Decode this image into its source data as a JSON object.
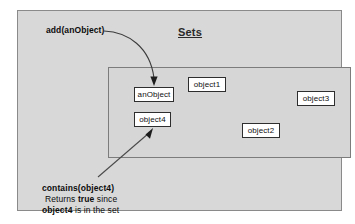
{
  "diagram": {
    "title": "Sets",
    "background_color": "#d8d8d8",
    "page_color": "#ffffff",
    "border_color": "#8a8a8a"
  },
  "set_container": {
    "label": "Sets",
    "fill": "#d6d6d6",
    "border": "#7c7c7c"
  },
  "objects": [
    {
      "id": "anObject",
      "label": "anObject"
    },
    {
      "id": "object4",
      "label": "object4"
    },
    {
      "id": "object1",
      "label": "object1"
    },
    {
      "id": "object2",
      "label": "object2"
    },
    {
      "id": "object3",
      "label": "object3"
    }
  ],
  "annotations": {
    "add_call": "add(anObject)",
    "contains_call": "contains(object4)",
    "contains_line2_pre": "Returns ",
    "contains_line2_bold": "true",
    "contains_line2_post": " since",
    "contains_line3_bold": "object4",
    "contains_line3_post": " is in the set"
  },
  "arrows": [
    {
      "name": "add-arrow",
      "style": "curved",
      "from": "add(anObject)",
      "to": "anObject"
    },
    {
      "name": "contains-arrow",
      "style": "straight",
      "from": "contains(object4)",
      "to": "object4"
    }
  ]
}
